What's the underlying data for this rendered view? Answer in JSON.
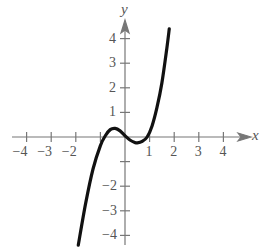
{
  "chart_data": {
    "type": "line",
    "title": "",
    "xlabel": "x",
    "ylabel": "y",
    "xlim": [
      -4.5,
      4.8
    ],
    "ylim": [
      -4.5,
      4.7
    ],
    "grid": false,
    "legend": null,
    "x_ticks": [
      -4,
      -3,
      -2,
      -1,
      1,
      2,
      3,
      4
    ],
    "x_tick_labels": [
      "−4",
      "−3",
      "−2",
      "1",
      "2",
      "3",
      "4"
    ],
    "y_ticks": [
      -4,
      -3,
      -2,
      -1,
      1,
      2,
      3,
      4
    ],
    "y_tick_labels": [
      "4",
      "3",
      "2",
      "1",
      "−2",
      "−3",
      "−4"
    ],
    "series": [
      {
        "name": "f(x)",
        "x": [
          -1.9,
          -1.6,
          -1.3,
          -1.0,
          -0.8,
          -0.6,
          -0.4,
          -0.2,
          0.0,
          0.2,
          0.4,
          0.5,
          0.7,
          0.9,
          1.1,
          1.3,
          1.5,
          1.7,
          1.8
        ],
        "y": [
          -4.4,
          -2.7,
          -1.3,
          -0.35,
          0.05,
          0.3,
          0.35,
          0.25,
          0.05,
          -0.12,
          -0.22,
          -0.24,
          -0.18,
          0.0,
          0.45,
          1.2,
          2.2,
          3.6,
          4.4
        ]
      }
    ]
  }
}
